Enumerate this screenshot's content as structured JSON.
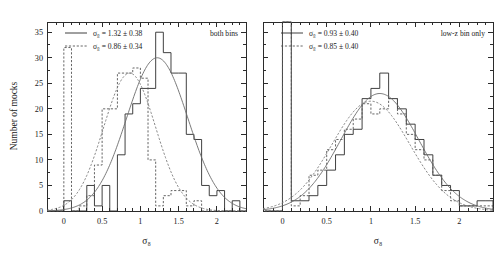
{
  "figure": {
    "width": 501,
    "height": 258,
    "background": "#ffffff",
    "ink_color": "#2b2b2b",
    "fit_color": "#6b6b6b"
  },
  "chart_data": [
    {
      "type": "bar",
      "panel_id": "left",
      "panel_label": "both bins",
      "title": "",
      "xlabel": "σ₈",
      "ylabel": "Number of mocks",
      "xlim": [
        -0.22,
        2.38
      ],
      "ylim": [
        0,
        37
      ],
      "xticks": [
        0,
        0.5,
        1,
        1.5,
        2
      ],
      "xticklabels": [
        "0",
        "0.5",
        "1",
        "1.5",
        "2"
      ],
      "yticks": [
        0,
        5,
        10,
        15,
        20,
        25,
        30,
        35
      ],
      "yticklabels": [
        "0",
        "5",
        "10",
        "15",
        "20",
        "25",
        "30",
        "35"
      ],
      "grid": false,
      "bin_width": 0.1,
      "legend_position": "top-left",
      "series": [
        {
          "name": "solid-histogram",
          "style": "solid",
          "legend": "σ₈ = 1.32 ± 0.38",
          "mean": 1.32,
          "sigma": 0.38,
          "peak": 30,
          "bin_left_edges": [
            -0.2,
            -0.1,
            0.0,
            0.1,
            0.2,
            0.3,
            0.4,
            0.5,
            0.6,
            0.7,
            0.8,
            0.9,
            1.0,
            1.1,
            1.2,
            1.3,
            1.4,
            1.5,
            1.6,
            1.7,
            1.8,
            1.9,
            2.0,
            2.1,
            2.2,
            2.3
          ],
          "values": [
            0,
            0,
            2,
            0,
            0,
            5,
            1,
            5,
            0,
            11,
            19,
            21,
            24,
            24,
            35,
            31,
            27,
            27,
            15,
            14,
            5,
            3,
            4,
            0,
            2,
            0
          ]
        },
        {
          "name": "dashed-histogram",
          "style": "dashed",
          "legend": "σ₈ = 0.86 ± 0.34",
          "mean": 0.86,
          "sigma": 0.34,
          "peak": 32,
          "bin_left_edges": [
            -0.2,
            -0.1,
            0.0,
            0.1,
            0.2,
            0.3,
            0.4,
            0.5,
            0.6,
            0.7,
            0.8,
            0.9,
            1.0,
            1.1,
            1.2,
            1.3,
            1.4,
            1.5,
            1.6,
            1.7,
            1.8,
            1.9,
            2.0,
            2.1,
            2.2,
            2.3
          ],
          "values": [
            0,
            0,
            32,
            0,
            1,
            3,
            9,
            20,
            20,
            27,
            27,
            28,
            26,
            10,
            1,
            3,
            4,
            4,
            1,
            2,
            0,
            0,
            0,
            0,
            0,
            0
          ]
        }
      ],
      "fits": [
        {
          "name": "solid-gaussian-fit",
          "style": "solid",
          "amplitude": 30,
          "mean": 1.22,
          "sigma": 0.4
        },
        {
          "name": "dashed-gaussian-fit",
          "style": "dashed",
          "amplitude": 27,
          "mean": 0.86,
          "sigma": 0.34
        }
      ]
    },
    {
      "type": "bar",
      "panel_id": "right",
      "panel_label": "low-z bin only",
      "title": "",
      "xlabel": "σ₈",
      "ylabel": "",
      "xlim": [
        -0.22,
        2.38
      ],
      "ylim": [
        0,
        37
      ],
      "xticks": [
        0,
        0.5,
        1,
        1.5,
        2
      ],
      "xticklabels": [
        "0",
        "0.5",
        "1",
        "1.5",
        "2"
      ],
      "yticks": [
        0,
        5,
        10,
        15,
        20,
        25,
        30,
        35
      ],
      "yticklabels": [],
      "grid": false,
      "bin_width": 0.1,
      "legend_position": "top-left",
      "series": [
        {
          "name": "solid-histogram",
          "style": "solid",
          "legend": "σ₈ = 0.93 ± 0.40",
          "mean": 0.93,
          "sigma": 0.4,
          "peak": 37,
          "bin_left_edges": [
            -0.2,
            -0.1,
            0.0,
            0.1,
            0.2,
            0.3,
            0.4,
            0.5,
            0.6,
            0.7,
            0.8,
            0.9,
            1.0,
            1.1,
            1.2,
            1.3,
            1.4,
            1.5,
            1.6,
            1.7,
            1.8,
            1.9,
            2.0,
            2.1,
            2.2,
            2.3
          ],
          "values": [
            0,
            0,
            37,
            2,
            2,
            3,
            5,
            8,
            11,
            15,
            16,
            22,
            24,
            27,
            22,
            20,
            17,
            14,
            11,
            7,
            5,
            4,
            1,
            1,
            2,
            2
          ]
        },
        {
          "name": "dashed-histogram",
          "style": "dashed",
          "legend": "σ₈ = 0.85 ± 0.40",
          "mean": 0.85,
          "sigma": 0.4,
          "peak": 37,
          "bin_left_edges": [
            -0.2,
            -0.1,
            0.0,
            0.1,
            0.2,
            0.3,
            0.4,
            0.5,
            0.6,
            0.7,
            0.8,
            0.9,
            1.0,
            1.1,
            1.2,
            1.3,
            1.4,
            1.5,
            1.6,
            1.7,
            1.8,
            1.9,
            2.0,
            2.1,
            2.2,
            2.3
          ],
          "values": [
            0,
            0,
            37,
            1,
            3,
            7,
            8,
            12,
            14,
            16,
            18,
            21,
            19,
            20,
            22,
            19,
            15,
            12,
            10,
            7,
            4,
            2,
            1,
            1,
            1,
            1
          ]
        }
      ],
      "fits": [
        {
          "name": "solid-gaussian-fit",
          "style": "solid",
          "amplitude": 23,
          "mean": 1.1,
          "sigma": 0.44
        },
        {
          "name": "dashed-gaussian-fit",
          "style": "dashed",
          "amplitude": 21.5,
          "mean": 1.0,
          "sigma": 0.44
        }
      ]
    }
  ]
}
